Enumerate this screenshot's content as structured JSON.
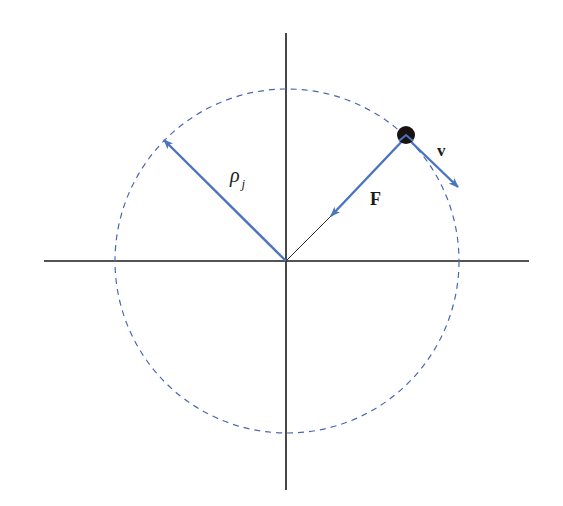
{
  "diagram": {
    "colors": {
      "background": "#ffffff",
      "axes": "#1a1a1a",
      "vector": "#4a74bf",
      "orbit": "#4a68b0",
      "particle": "#1a1210",
      "text": "#1a1a1a"
    },
    "origin": {
      "x": 286,
      "y": 261
    },
    "axes": {
      "horizontal": {
        "x1": 44,
        "x2": 529,
        "y": 261
      },
      "vertical": {
        "x": 286,
        "y1": 33,
        "y2": 490
      }
    },
    "orbit": {
      "cx": 287,
      "cy": 261,
      "r": 172,
      "style": "dashed"
    },
    "particle": {
      "x": 406,
      "y": 137,
      "r": 9
    },
    "vectors": [
      {
        "id": "rho",
        "label": "ρ",
        "subscript": "j",
        "from": [
          286,
          261
        ],
        "to": [
          164,
          140
        ]
      },
      {
        "id": "F",
        "label": "F",
        "from": [
          406,
          137
        ],
        "to": [
          331,
          216
        ],
        "style": "bold"
      },
      {
        "id": "v",
        "label": "v",
        "from": [
          406,
          137
        ],
        "to": [
          458,
          187
        ],
        "style": "bold"
      }
    ],
    "labels": {
      "rho": "ρ",
      "rho_sub": "j",
      "force": "F",
      "velocity": "v"
    }
  }
}
